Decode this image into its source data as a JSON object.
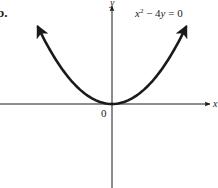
{
  "figure": {
    "label": "b.",
    "equation": {
      "x": "x",
      "exp": "2",
      "rest": " − 4",
      "y": "y",
      "eq": " = 0",
      "full": "x² − 4y = 0"
    },
    "axes": {
      "x_label": "x",
      "y_label": "y",
      "origin_label": "0"
    },
    "curve": {
      "type": "parabola",
      "equation": "x^2 - 4y = 0",
      "vertex": [
        0,
        0
      ],
      "opens": "up",
      "arrows_on_both_ends": true
    },
    "colors": {
      "ink": "#1a1a1a",
      "background": "#ffffff"
    }
  }
}
